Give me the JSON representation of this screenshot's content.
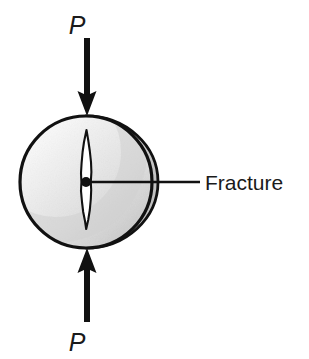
{
  "figure": {
    "type": "diagram",
    "background_color": "#ffffff",
    "ink_color": "#111111"
  },
  "labels": {
    "load_top": "P",
    "load_bottom": "P",
    "callout": "Fracture"
  },
  "specimen": {
    "shape_name": "cylindrical-disk",
    "center_x": 86,
    "center_y": 182,
    "radius": 66,
    "outline_color": "#111111",
    "outline_width": 3.2,
    "fill_light": "#fbfbfb",
    "fill_mid": "#e6e6e6",
    "fill_dark": "#c9c9c9",
    "depth_arc_offset": 7
  },
  "fracture": {
    "name": "vertical-crack",
    "top_y": 130,
    "bottom_y": 229,
    "max_half_width": 5,
    "interior_color": "#ffffff",
    "outline_color": "#111111"
  },
  "center_marker": {
    "name": "center-dot",
    "x": 86,
    "y": 182,
    "radius": 5,
    "color": "#111111"
  },
  "leader_line": {
    "from_x": 86,
    "to_x": 200,
    "y": 182,
    "width": 2.4,
    "color": "#111111"
  },
  "arrows": [
    {
      "name": "load-arrow-top",
      "direction": "down",
      "x": 87,
      "tail_y": 38,
      "tip_y": 115,
      "shaft_width": 6,
      "head_width": 19,
      "head_length": 25,
      "color": "#111111"
    },
    {
      "name": "load-arrow-bottom",
      "direction": "up",
      "x": 87,
      "tail_y": 322,
      "tip_y": 249,
      "shaft_width": 6,
      "head_width": 19,
      "head_length": 25,
      "color": "#111111"
    }
  ],
  "text_positions": {
    "load_top_x": 77,
    "load_top_y": 34,
    "load_bottom_x": 77,
    "load_bottom_y": 351,
    "callout_x": 205,
    "callout_y": 190
  }
}
